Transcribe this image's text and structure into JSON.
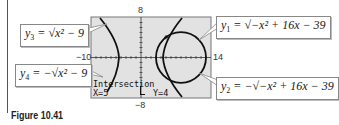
{
  "figure": {
    "caption": "Figure 10.41",
    "window": {
      "xmin": -10,
      "xmax": 14,
      "ymin": -8,
      "ymax": 8
    },
    "axis_labels": {
      "ymax": "8",
      "ymin": "−8",
      "xmin": "−10",
      "xmax": "14"
    },
    "calculator_readout": {
      "title": "Intersection",
      "x": "X=5",
      "y": "Y=4"
    },
    "equations": {
      "y1": {
        "name": "y",
        "sub": "1",
        "rhs": " = √−x² + 16x − 39"
      },
      "y2": {
        "name": "y",
        "sub": "2",
        "rhs": " = −√−x² + 16x − 39"
      },
      "y3": {
        "name": "y",
        "sub": "3",
        "rhs": " = √x² − 9"
      },
      "y4": {
        "name": "y",
        "sub": "4",
        "rhs": " = −√x² − 9"
      }
    },
    "intersection_point": {
      "x": 5,
      "y": 4
    },
    "colors": {
      "screen_bg": "#e2e2e2",
      "curve": "#111111",
      "border": "#777777"
    }
  }
}
